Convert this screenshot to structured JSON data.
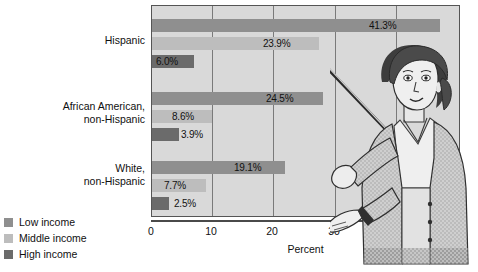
{
  "chart_data": {
    "type": "bar",
    "orientation": "horizontal",
    "title": "",
    "xlabel": "Percent",
    "ylabel": "",
    "xlim": [
      0,
      44
    ],
    "grid": true,
    "legend_position": "bottom-left",
    "categories": [
      "Hispanic",
      "African American, non-Hispanic",
      "White, non-Hispanic"
    ],
    "category_lines": [
      [
        "Hispanic"
      ],
      [
        "African American,",
        "non-Hispanic"
      ],
      [
        "White,",
        "non-Hispanic"
      ]
    ],
    "series": [
      {
        "name": "Low income",
        "color": "#8f8f8f",
        "values": [
          41.3,
          24.5,
          19.1
        ],
        "labels": [
          "41.3%",
          "24.5%",
          "19.1%"
        ]
      },
      {
        "name": "Middle income",
        "color": "#bdbdbd",
        "values": [
          23.9,
          8.6,
          7.7
        ],
        "labels": [
          "23.9%",
          "8.6%",
          "7.7%"
        ]
      },
      {
        "name": "High income",
        "color": "#6b6b6b",
        "values": [
          6.0,
          3.9,
          2.5
        ],
        "labels": [
          "6.0%",
          "3.9%",
          "2.5%"
        ]
      }
    ],
    "xticks": [
      0,
      10,
      20,
      30,
      40
    ],
    "xtick_labels": [
      "0",
      "10",
      "20",
      "30",
      "40"
    ]
  },
  "legend": {
    "items": [
      {
        "label": "Low income",
        "color": "#8f8f8f"
      },
      {
        "label": "Middle income",
        "color": "#bdbdbd"
      },
      {
        "label": "High income",
        "color": "#6b6b6b"
      }
    ]
  },
  "axis": {
    "title": "Percent",
    "ticks": [
      "0",
      "10",
      "20",
      "30",
      "40"
    ]
  },
  "labels": {
    "cat0_line0": "Hispanic",
    "cat1_line0": "African American,",
    "cat1_line1": "non-Hispanic",
    "cat2_line0": "White,",
    "cat2_line1": "non-Hispanic",
    "v_hisp_low": "41.3%",
    "v_hisp_mid": "23.9%",
    "v_hisp_high": "6.0%",
    "v_aa_low": "24.5%",
    "v_aa_mid": "8.6%",
    "v_aa_high": "3.9%",
    "v_wh_low": "19.1%",
    "v_wh_mid": "7.7%",
    "v_wh_high": "2.5%"
  },
  "illustration": {
    "name": "woman-with-pointer-illustration"
  }
}
